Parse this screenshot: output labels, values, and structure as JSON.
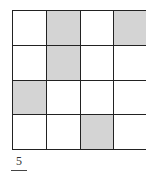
{
  "grid": {
    "rows": 4,
    "cols": 4,
    "shaded_color": "#d4d4d4",
    "cells": [
      [
        false,
        true,
        false,
        true
      ],
      [
        false,
        true,
        false,
        false
      ],
      [
        true,
        false,
        false,
        false
      ],
      [
        false,
        false,
        true,
        false
      ]
    ]
  },
  "fraction": {
    "numerator": "5"
  }
}
